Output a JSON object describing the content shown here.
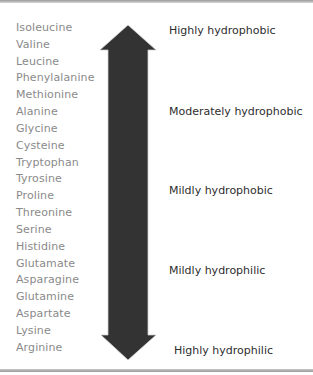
{
  "amino_acids": [
    "Isoleucine",
    "Valine",
    "Leucine",
    "Phenylalanine",
    "Methionine",
    "Alanine",
    "Glycine",
    "Cysteine",
    "Tryptophan",
    "Tyrosine",
    "Proline",
    "Threonine",
    "Serine",
    "Histidine",
    "Glutamate",
    "Asparagine",
    "Glutamine",
    "Aspartate",
    "Lysine",
    "Arginine"
  ],
  "scale_labels": [
    {
      "text": "Highly hydrophobic",
      "x": 169,
      "y": 30
    },
    {
      "text": "Moderately hydrophobic",
      "x": 169,
      "y": 111
    },
    {
      "text": "Mildly hydrophobic",
      "x": 169,
      "y": 190
    },
    {
      "text": "Mildly hydrophilic",
      "x": 169,
      "y": 270
    },
    {
      "text": "Highly hydrophilic",
      "x": 174,
      "y": 350
    }
  ],
  "arrow": {
    "direction": "double-headed vertical",
    "gradient_top_color": "#fbfbfb",
    "gradient_bottom_color": "#3a3a3a",
    "meaning": "gradient from hydrophobic (top, light) to hydrophilic (bottom, dark)"
  },
  "colors": {
    "amino_acid_text": "#8a8a8a",
    "label_text": "#2e2e2e",
    "rule": "#9a9a9a"
  }
}
